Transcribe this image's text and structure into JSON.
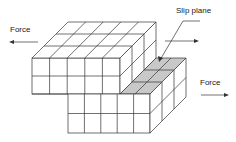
{
  "diagram": {
    "labels": {
      "force_left": "Force",
      "force_right": "Force",
      "slip_plane": "Slip plane"
    },
    "colors": {
      "line": "#333333",
      "slip_plane_fill": "#c8c8c8",
      "background": "#ffffff"
    },
    "blocks": {
      "upper": {
        "columns": 5,
        "rows": 2,
        "depth": 3
      },
      "lower": {
        "columns": 2,
        "rows": 2,
        "depth": 3
      },
      "slip_plane_cells": 6
    }
  }
}
